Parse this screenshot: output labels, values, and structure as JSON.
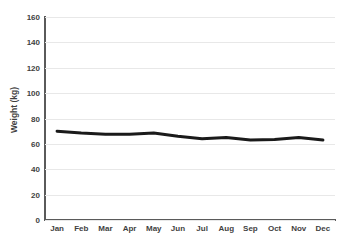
{
  "chart_data": {
    "type": "line",
    "title": "",
    "subtitle": "",
    "xlabel": "",
    "ylabel": "Weight (kg)",
    "categories": [
      "Jan",
      "Feb",
      "Mar",
      "Apr",
      "May",
      "Jun",
      "Jul",
      "Aug",
      "Sep",
      "Oct",
      "Nov",
      "Dec"
    ],
    "values": [
      70,
      68.5,
      67.5,
      67.5,
      68.5,
      66,
      64,
      65,
      63,
      63.5,
      65,
      63
    ],
    "series": [
      {
        "name": "Weight",
        "values": [
          70,
          68.5,
          67.5,
          67.5,
          68.5,
          66,
          64,
          65,
          63,
          63.5,
          65,
          63
        ],
        "color": "#1a1a1a",
        "line_width": 3
      }
    ],
    "ylim": [
      0,
      160
    ],
    "y_ticks": [
      0,
      20,
      40,
      60,
      80,
      100,
      120,
      140,
      160
    ],
    "y_tick_labels": [
      "0",
      "20",
      "40",
      "60",
      "80",
      "100",
      "120",
      "140",
      "160"
    ],
    "grid": true,
    "grid_axis": "y",
    "grid_color": "#e8e8e8",
    "legend": false,
    "legend_position": "none",
    "axis_color": "#5a5a5a",
    "text_color": "#3f3f3f",
    "background": "#ffffff",
    "markers": false
  }
}
